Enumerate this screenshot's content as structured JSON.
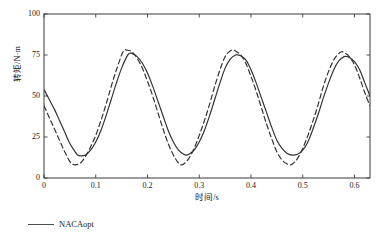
{
  "chart_data": {
    "type": "line",
    "title": "",
    "xlabel": "时间/s",
    "ylabel": "转矩/N·m",
    "xlim": [
      0,
      0.63
    ],
    "ylim": [
      0,
      100
    ],
    "xticks": [
      "0",
      "0.1",
      "0.2",
      "0.3",
      "0.4",
      "0.5",
      "0.6"
    ],
    "xtick_values": [
      0,
      0.1,
      0.2,
      0.3,
      0.4,
      0.5,
      0.6
    ],
    "yticks": [
      "0",
      "25",
      "50",
      "75",
      "100"
    ],
    "ytick_values": [
      0,
      25,
      50,
      75,
      100
    ],
    "grid": false,
    "legend_position": "below-left",
    "series": [
      {
        "name": "NACAopt",
        "style": "solid",
        "color": "#333333",
        "x": [
          0,
          0.01,
          0.02,
          0.03,
          0.04,
          0.05,
          0.06,
          0.065,
          0.07,
          0.08,
          0.09,
          0.1,
          0.11,
          0.12,
          0.13,
          0.14,
          0.15,
          0.16,
          0.165,
          0.17,
          0.18,
          0.19,
          0.2,
          0.21,
          0.22,
          0.23,
          0.24,
          0.25,
          0.26,
          0.27,
          0.275,
          0.28,
          0.29,
          0.3,
          0.31,
          0.32,
          0.33,
          0.34,
          0.35,
          0.36,
          0.37,
          0.375,
          0.38,
          0.39,
          0.4,
          0.41,
          0.42,
          0.43,
          0.44,
          0.45,
          0.46,
          0.47,
          0.48,
          0.49,
          0.5,
          0.51,
          0.52,
          0.53,
          0.54,
          0.55,
          0.56,
          0.57,
          0.58,
          0.585,
          0.59,
          0.6,
          0.61,
          0.62,
          0.63
        ],
        "y": [
          54,
          48,
          42,
          35,
          28,
          21,
          16,
          14,
          13.5,
          14,
          17,
          22,
          29,
          38,
          48,
          58,
          67,
          74,
          76,
          76,
          74,
          70,
          64,
          56,
          47,
          38,
          29,
          22,
          17,
          14.5,
          14,
          14.5,
          17,
          22,
          29,
          38,
          48,
          58,
          67,
          72.5,
          75,
          75,
          74.5,
          72,
          66,
          58,
          49,
          40,
          31,
          23,
          18,
          15,
          14,
          14.5,
          17,
          22,
          30,
          39,
          49,
          58,
          66,
          71.5,
          74,
          74,
          73.5,
          71,
          66,
          58,
          50
        ]
      },
      {
        "name": "对比",
        "style": "dashed",
        "color": "#333333",
        "x": [
          0,
          0.01,
          0.02,
          0.03,
          0.04,
          0.05,
          0.055,
          0.06,
          0.07,
          0.08,
          0.09,
          0.1,
          0.11,
          0.12,
          0.13,
          0.14,
          0.15,
          0.155,
          0.16,
          0.17,
          0.18,
          0.19,
          0.2,
          0.21,
          0.22,
          0.23,
          0.24,
          0.25,
          0.26,
          0.265,
          0.27,
          0.28,
          0.29,
          0.3,
          0.31,
          0.32,
          0.33,
          0.34,
          0.35,
          0.36,
          0.365,
          0.37,
          0.38,
          0.39,
          0.4,
          0.41,
          0.42,
          0.43,
          0.44,
          0.45,
          0.46,
          0.47,
          0.475,
          0.48,
          0.49,
          0.5,
          0.51,
          0.52,
          0.53,
          0.54,
          0.55,
          0.56,
          0.57,
          0.575,
          0.58,
          0.59,
          0.6,
          0.61,
          0.62,
          0.63
        ],
        "y": [
          44,
          37,
          30,
          23,
          16,
          10,
          8.5,
          8,
          9,
          13,
          19,
          26,
          35,
          45,
          56,
          66,
          75,
          78,
          78,
          77,
          73,
          67,
          59,
          50,
          40,
          30,
          21,
          14,
          9,
          8,
          8.5,
          12,
          18,
          26,
          35,
          45,
          56,
          66,
          74,
          77.5,
          78,
          77.5,
          75,
          70,
          62,
          53,
          43,
          33,
          24,
          16,
          11,
          8.5,
          8,
          8.5,
          12,
          18,
          26,
          35,
          45,
          56,
          65,
          72,
          76,
          77,
          76.5,
          74,
          69,
          61,
          52,
          44
        ]
      }
    ]
  },
  "legend": {
    "entries": [
      {
        "label": "NACAopt",
        "style": "solid"
      }
    ]
  },
  "axes": {
    "frame": true,
    "tick_direction": "in"
  }
}
